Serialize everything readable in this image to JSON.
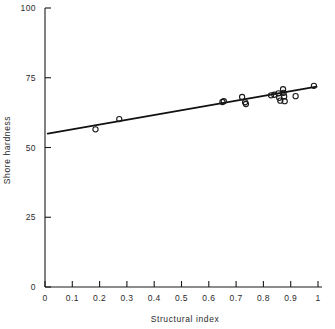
{
  "chart_data": {
    "type": "scatter",
    "title": "",
    "xlabel": "Structural index",
    "ylabel": "Shore hardness",
    "xlim": [
      0,
      1
    ],
    "ylim": [
      0,
      100
    ],
    "grid": false,
    "legend": "none",
    "marker_style": "open-circle",
    "xticks": [
      "0",
      "0.1",
      "0.2",
      "0.3",
      "0.4",
      "0.5",
      "0.6",
      "0.7",
      "0.8",
      "0.9",
      "1"
    ],
    "xtick_values": [
      0,
      0.1,
      0.2,
      0.3,
      0.4,
      0.5,
      0.6,
      0.7,
      0.8,
      0.9,
      1
    ],
    "yticks": [
      "0",
      "25",
      "50",
      "75",
      "100"
    ],
    "ytick_values": [
      0,
      25,
      50,
      75,
      100
    ],
    "points": [
      {
        "x": 0.185,
        "y": 56.5
      },
      {
        "x": 0.272,
        "y": 60.2
      },
      {
        "x": 0.65,
        "y": 66.3
      },
      {
        "x": 0.655,
        "y": 66.6
      },
      {
        "x": 0.722,
        "y": 68.1
      },
      {
        "x": 0.733,
        "y": 66.2
      },
      {
        "x": 0.736,
        "y": 65.6
      },
      {
        "x": 0.828,
        "y": 68.7
      },
      {
        "x": 0.84,
        "y": 68.9
      },
      {
        "x": 0.855,
        "y": 69.4
      },
      {
        "x": 0.858,
        "y": 67.8
      },
      {
        "x": 0.862,
        "y": 66.8
      },
      {
        "x": 0.872,
        "y": 70.9
      },
      {
        "x": 0.874,
        "y": 69.6
      },
      {
        "x": 0.876,
        "y": 68.3
      },
      {
        "x": 0.878,
        "y": 66.6
      },
      {
        "x": 0.918,
        "y": 68.4
      },
      {
        "x": 0.985,
        "y": 72.1
      }
    ],
    "fit_line": {
      "type": "linear",
      "x_start": 0.01,
      "y_start": 55.0,
      "x_end": 0.995,
      "y_end": 71.8
    }
  }
}
